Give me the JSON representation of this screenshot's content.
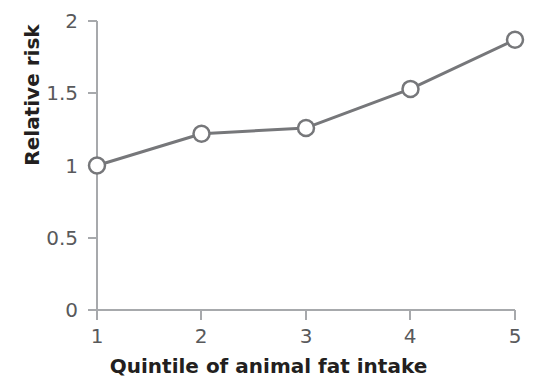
{
  "chart_data": {
    "type": "line",
    "title": "",
    "xlabel": "Quintile of animal fat intake",
    "ylabel": "Relative risk",
    "x": [
      1,
      2,
      3,
      4,
      5
    ],
    "values": [
      1.0,
      1.22,
      1.26,
      1.53,
      1.87
    ],
    "categories": [
      "1",
      "2",
      "3",
      "4",
      "5"
    ],
    "xtick_labels": [
      "1",
      "2",
      "3",
      "4",
      "5"
    ],
    "ytick_labels": [
      "0",
      "0.5",
      "1",
      "1.5",
      "2"
    ],
    "ytick_values": [
      0,
      0.5,
      1,
      1.5,
      2
    ],
    "xlim": [
      1,
      5
    ],
    "ylim": [
      0,
      2
    ],
    "grid": false,
    "legend": null,
    "series": [
      {
        "name": "Relative risk",
        "values": [
          1.0,
          1.22,
          1.26,
          1.53,
          1.87
        ]
      }
    ],
    "marker": "open-circle",
    "colors": {
      "line": "#76777a",
      "marker_fill": "#ffffff",
      "marker_stroke": "#76777a",
      "axis": "#a7a9ac",
      "tick_text": "#58595b",
      "title_text": "#231f20",
      "background": "#ffffff"
    }
  }
}
